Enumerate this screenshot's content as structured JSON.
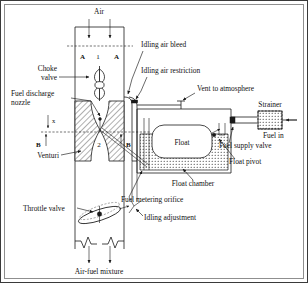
{
  "figure": {
    "type": "engineering-diagram"
  },
  "labels": {
    "air": "Air",
    "choke_valve": "Choke",
    "choke_valve_2": "valve",
    "fuel_discharge": "Fuel discharge",
    "fuel_discharge_2": "nozzle",
    "venturi": "Venturi",
    "throttle_valve": "Throttle valve",
    "air_fuel_mixture": "Air-fuel mixture",
    "idling_air_bleed": "Idling air bleed",
    "idling_air_restriction": "Idling air restriction",
    "vent_to_atmosphere": "Vent to atmosphere",
    "strainer": "Strainer",
    "fuel_in": "Fuel in",
    "fuel_supply_valve": "Fuel supply valve",
    "float": "Float",
    "float_pivot": "Float pivot",
    "float_chamber": "Float chamber",
    "fuel_metering_orifice": "Fuel metering orifice",
    "idling_adjustment": "Idling adjustment"
  },
  "section_marks": {
    "a_left": "A",
    "a_right": "A",
    "a_number": "1",
    "b_left": "B",
    "b_right": "B",
    "b_number": "2",
    "dim_x": "x"
  },
  "colors": {
    "ink": "#1a1a1a",
    "frame": "#3a3a3a",
    "inner_frame": "#8f8f8f",
    "paper": "#ffffff"
  }
}
